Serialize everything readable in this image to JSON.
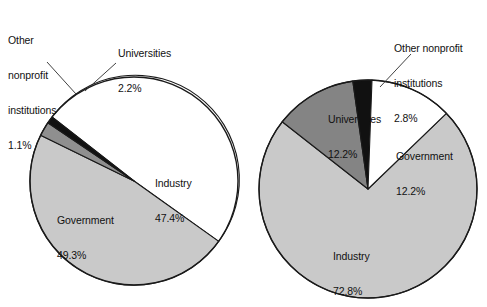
{
  "figure": {
    "background_color": "#ffffff",
    "text_color": "#111111",
    "outline_color": "#1a1a1a"
  },
  "palette": {
    "industry": "#c9c9c9",
    "government": "#ffffff",
    "universities_left": "#8f8f8f",
    "universities_right": "#848484",
    "other_nonprofit": "#111111"
  },
  "chart_data": [
    {
      "type": "pie",
      "id": "left-pie",
      "title": "",
      "categories": [
        "Government",
        "Industry",
        "Universities",
        "Other nonprofit institutions"
      ],
      "values": [
        49.3,
        47.4,
        2.2,
        1.1
      ],
      "value_labels": [
        "49.3%",
        "47.4%",
        "2.2%",
        "1.1%"
      ],
      "colors": [
        "#ffffff",
        "#c9c9c9",
        "#8f8f8f",
        "#111111"
      ],
      "geometry": {
        "cx": 134,
        "cy": 181,
        "r": 104,
        "start_angle_deg": -52
      },
      "labels": [
        {
          "name": "other-nonprofit",
          "text_lines": [
            "Other",
            "nonprofit",
            "institutions",
            "1.1%"
          ],
          "placement": "outside",
          "leader": true
        },
        {
          "name": "universities",
          "text_lines": [
            "Universities",
            "2.2%"
          ],
          "placement": "outside",
          "leader": true
        },
        {
          "name": "industry",
          "text_lines": [
            "Industry",
            "47.4%"
          ],
          "placement": "inside",
          "leader": false
        },
        {
          "name": "government",
          "text_lines": [
            "Government",
            "49.3%"
          ],
          "placement": "inside",
          "leader": false
        }
      ]
    },
    {
      "type": "pie",
      "id": "right-pie",
      "title": "",
      "categories": [
        "Other nonprofit institutions",
        "Government",
        "Industry",
        "Universities"
      ],
      "values": [
        2.8,
        12.2,
        72.8,
        12.2
      ],
      "value_labels": [
        "2.8%",
        "12.2%",
        "72.8%",
        "12.2%"
      ],
      "colors": [
        "#111111",
        "#ffffff",
        "#c9c9c9",
        "#848484"
      ],
      "geometry": {
        "cx": 368,
        "cy": 189,
        "r": 109,
        "start_angle_deg": -8
      },
      "labels": [
        {
          "name": "other-nonprofit",
          "text_lines": [
            "Other nonprofit",
            "institutions",
            "2.8%"
          ],
          "placement": "outside",
          "leader": true
        },
        {
          "name": "government",
          "text_lines": [
            "Government",
            "12.2%"
          ],
          "placement": "inside",
          "leader": false
        },
        {
          "name": "industry",
          "text_lines": [
            "Industry",
            "72.8%"
          ],
          "placement": "inside",
          "leader": false
        },
        {
          "name": "universities",
          "text_lines": [
            "Universities",
            "12.2%"
          ],
          "placement": "inside",
          "leader": false
        }
      ]
    }
  ],
  "left_chart": {
    "other_nonprofit_label": {
      "line1": "Other",
      "line2": "nonprofit",
      "line3": "institutions",
      "line4": "1.1%"
    },
    "universities_label": {
      "line1": "Universities",
      "line2": "2.2%"
    },
    "industry_label": {
      "line1": "Industry",
      "line2": "47.4%"
    },
    "government_label": {
      "line1": "Government",
      "line2": "49.3%"
    }
  },
  "right_chart": {
    "other_nonprofit_label": {
      "line1": "Other nonprofit",
      "line2": "institutions",
      "line3": "2.8%"
    },
    "universities_label": {
      "line1": "Universities",
      "line2": "12.2%"
    },
    "government_label": {
      "line1": "Government",
      "line2": "12.2%"
    },
    "industry_label": {
      "line1": "Industry",
      "line2": "72.8%"
    }
  }
}
